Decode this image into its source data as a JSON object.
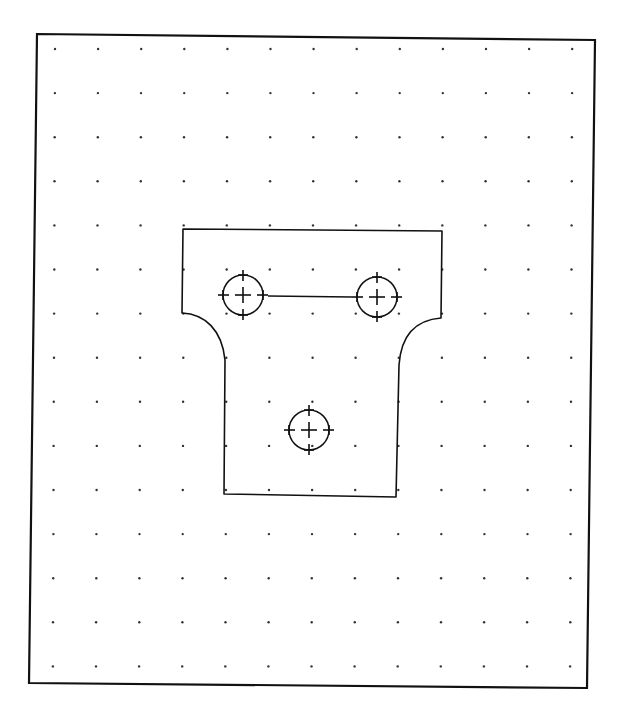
{
  "drawing": {
    "type": "cad-sketch",
    "colors": {
      "background": "#ffffff",
      "ink": "#111111",
      "grid_dot": "#333333"
    },
    "border": {
      "corners": [
        [
          37,
          34
        ],
        [
          595,
          40
        ],
        [
          587,
          688
        ],
        [
          29,
          683
        ]
      ]
    },
    "grid": {
      "origin": [
        55,
        49
      ],
      "step_x": 43.1,
      "step_y": 44.1,
      "cols": 13,
      "rows": 15,
      "skew_x_per_row": -0.15,
      "skew_y_per_col": 0.0
    },
    "part": {
      "name": "flanged bracket plate",
      "outline_path": "M 183 229 L 442 231 L 441 318 C 415 320 401 336 399 365 L 396 497 L 224 494 L 225 360 C 222 330 205 314 182 313 Z",
      "holes": [
        {
          "id": "hole-1",
          "cx": 243,
          "cy": 295,
          "r": 20,
          "tick": 25
        },
        {
          "id": "hole-2",
          "cx": 377,
          "cy": 297,
          "r": 20,
          "tick": 25
        },
        {
          "id": "hole-3",
          "cx": 309,
          "cy": 430,
          "r": 20,
          "tick": 25
        }
      ],
      "links": [
        {
          "from": "hole-1",
          "to": "hole-2",
          "x1": 268,
          "y1": 296,
          "x2": 352,
          "y2": 297
        }
      ]
    }
  }
}
